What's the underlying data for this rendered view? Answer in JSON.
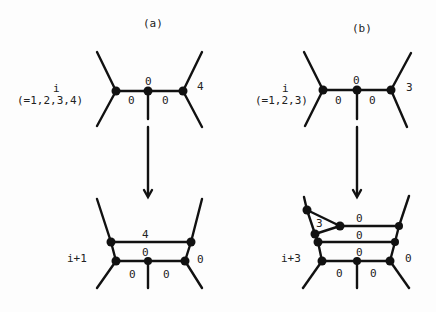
{
  "panels": {
    "a": {
      "title": "(a)",
      "top": {
        "level_label": "i",
        "range_label": "(=1,2,3,4)",
        "edge_labels": {
          "left": "0",
          "top": "0",
          "right": "0",
          "outer_right": "4"
        }
      },
      "bottom": {
        "level_label": "i+1",
        "edge_labels": {
          "upper": "4",
          "middle": "0",
          "lower_left": "0",
          "lower_right": "0",
          "outer_right": "0"
        }
      }
    },
    "b": {
      "title": "(b)",
      "top": {
        "level_label": "i",
        "range_label": "(=1,2,3)",
        "edge_labels": {
          "left": "0",
          "top": "0",
          "right": "0",
          "outer_right": "3"
        }
      },
      "bottom": {
        "level_label": "i+3",
        "edge_labels": {
          "triangle": "3",
          "row1": "0",
          "row2": "0",
          "row3": "0",
          "lower_left": "0",
          "lower_right": "0",
          "outer_right": "0"
        }
      }
    }
  }
}
